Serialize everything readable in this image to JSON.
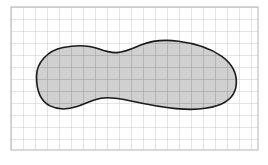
{
  "figure": {
    "kind": "region-on-grid",
    "canvas": {
      "width": 268,
      "height": 165,
      "background": "#ffffff"
    },
    "grid": {
      "visible": true,
      "cell_size_px": 12,
      "origin_x_px": 11,
      "origin_y_px": 7,
      "columns": 21,
      "rows": 12,
      "line_color_outside": "#c9c9c9",
      "line_color_inside": "#8a8a8a",
      "line_width_px": 1,
      "border_color": "#b4b4b4",
      "border_box": {
        "x": 11,
        "y": 7,
        "width": 247,
        "height": 143
      }
    },
    "region": {
      "name": "peanut-blob",
      "fill_color": "#b3b3b3",
      "fill_opacity": 0.62,
      "stroke_color": "#1a1a1a",
      "stroke_width_px": 1.6,
      "bounds_px": {
        "x": 36,
        "y": 41,
        "width": 201,
        "height": 68
      },
      "description": "Elongated peanut-shaped closed curve with a narrow waist near the middle, a smaller rounded left lobe and a larger rounded right lobe.",
      "path": "M 36.5 76.5 C 36.5 62.0 48.0 50.5 63.0 47.5 C 76.0 44.9 89.0 45.4 98.5 48.8 C 106.0 51.5 110.5 53.0 117.0 52.6 C 126.0 52.0 133.5 48.0 141.5 44.8 C 152.5 40.4 166.0 39.6 178.5 41.2 C 196.0 43.4 211.0 48.6 221.5 56.2 C 232.0 63.8 237.0 73.8 236.3 84.0 C 235.6 94.4 228.5 101.8 217.5 105.6 C 206.0 109.6 191.0 110.0 176.0 108.6 C 160.0 107.1 145.0 104.0 131.0 101.0 C 120.0 98.6 110.5 96.6 101.0 98.2 C 92.0 99.7 85.0 104.0 77.0 106.6 C 68.0 109.5 58.0 109.9 50.0 105.9 C 41.5 101.6 36.5 91.5 36.5 76.5 Z",
      "control_points_px": [
        [
          36.5,
          76.5
        ],
        [
          63.0,
          47.5
        ],
        [
          98.5,
          48.8
        ],
        [
          117.0,
          52.6
        ],
        [
          141.5,
          44.8
        ],
        [
          178.5,
          41.2
        ],
        [
          221.5,
          56.2
        ],
        [
          236.3,
          84.0
        ],
        [
          217.5,
          105.6
        ],
        [
          176.0,
          108.6
        ],
        [
          131.0,
          101.0
        ],
        [
          101.0,
          98.2
        ],
        [
          77.0,
          106.6
        ],
        [
          50.0,
          105.9
        ]
      ]
    }
  }
}
